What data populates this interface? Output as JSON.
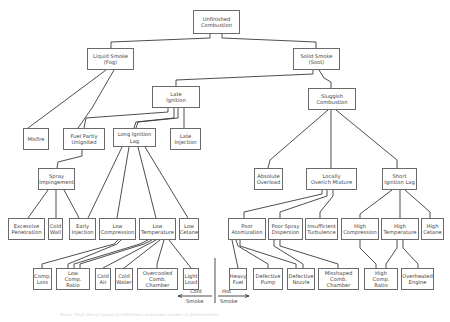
{
  "diagram": {
    "title": "Unfinished Combustion",
    "nodes": [
      {
        "id": "unfinished",
        "label": "Unfinished\nCombustion",
        "x": 193,
        "y": 10,
        "w": 47,
        "h": 24
      },
      {
        "id": "liquid",
        "label": "Liquid Smoke\n(Fog)",
        "x": 87,
        "y": 48,
        "w": 47,
        "h": 22
      },
      {
        "id": "solid",
        "label": "Solid Smoke\n(Soot)",
        "x": 293,
        "y": 48,
        "w": 47,
        "h": 22
      },
      {
        "id": "late_ign",
        "label": "Late\nIgnition",
        "x": 152,
        "y": 86,
        "w": 48,
        "h": 22
      },
      {
        "id": "sluggish",
        "label": "Sluggish\nCombustion",
        "x": 308,
        "y": 88,
        "w": 48,
        "h": 22
      },
      {
        "id": "misfire",
        "label": "Misfire",
        "x": 23,
        "y": 128,
        "w": 26,
        "h": 22
      },
      {
        "id": "fuel_partly",
        "label": "Fuel Partly\nUnignited",
        "x": 63,
        "y": 128,
        "w": 42,
        "h": 22
      },
      {
        "id": "long_lag",
        "label": "Long Ignition\nLag",
        "x": 113,
        "y": 128,
        "w": 43,
        "h": 19
      },
      {
        "id": "late_inj",
        "label": "Late\nInjection",
        "x": 170,
        "y": 128,
        "w": 31,
        "h": 22
      },
      {
        "id": "spray_imp",
        "label": "Spray\nImpingement",
        "x": 38,
        "y": 168,
        "w": 37,
        "h": 22
      },
      {
        "id": "abs_overload",
        "label": "Absolute\nOverload",
        "x": 254,
        "y": 168,
        "w": 29,
        "h": 22
      },
      {
        "id": "overich",
        "label": "Locally\nOverich Mixture",
        "x": 306,
        "y": 168,
        "w": 51,
        "h": 22
      },
      {
        "id": "short_lag",
        "label": "Short\nIgnition Lag",
        "x": 382,
        "y": 168,
        "w": 35,
        "h": 22
      },
      {
        "id": "exc_pen",
        "label": "Excessive\nPenetration",
        "x": 8,
        "y": 218,
        "w": 37,
        "h": 22
      },
      {
        "id": "cold_wall",
        "label": "Cold\nWall",
        "x": 48,
        "y": 218,
        "w": 15,
        "h": 22
      },
      {
        "id": "early_inj",
        "label": "Early\nInjection",
        "x": 69,
        "y": 218,
        "w": 27,
        "h": 22
      },
      {
        "id": "low_comp",
        "label": "Low\nCompression",
        "x": 99,
        "y": 218,
        "w": 37,
        "h": 22
      },
      {
        "id": "low_temp",
        "label": "Low\nTemperature",
        "x": 139,
        "y": 218,
        "w": 37,
        "h": 22
      },
      {
        "id": "low_cet",
        "label": "Low\nCetane",
        "x": 179,
        "y": 218,
        "w": 20,
        "h": 22
      },
      {
        "id": "poor_atom",
        "label": "Poor\nAtomization",
        "x": 228,
        "y": 218,
        "w": 38,
        "h": 22
      },
      {
        "id": "poor_spray",
        "label": "Poor Spray\nDispersion",
        "x": 268,
        "y": 218,
        "w": 35,
        "h": 22
      },
      {
        "id": "insuff_turb",
        "label": "Insufficient\nTurbulence",
        "x": 305,
        "y": 218,
        "w": 33,
        "h": 22
      },
      {
        "id": "high_comp",
        "label": "High\nCompression",
        "x": 341,
        "y": 218,
        "w": 38,
        "h": 22
      },
      {
        "id": "high_temp",
        "label": "High\nTemperature",
        "x": 381,
        "y": 218,
        "w": 38,
        "h": 22
      },
      {
        "id": "high_cet",
        "label": "High\nCetane",
        "x": 421,
        "y": 218,
        "w": 23,
        "h": 22
      },
      {
        "id": "comp_loss",
        "label": "Comp.\nLoss",
        "x": 33,
        "y": 268,
        "w": 19,
        "h": 22
      },
      {
        "id": "low_ratio",
        "label": "Low\nComp. Ratio",
        "x": 56,
        "y": 268,
        "w": 34,
        "h": 22
      },
      {
        "id": "cold_air",
        "label": "Cold\nAir",
        "x": 95,
        "y": 268,
        "w": 16,
        "h": 22
      },
      {
        "id": "cold_water",
        "label": "Cold\nWater",
        "x": 115,
        "y": 268,
        "w": 18,
        "h": 22
      },
      {
        "id": "overcooled",
        "label": "Overcooled\nComb.\nChamber",
        "x": 137,
        "y": 268,
        "w": 41,
        "h": 22
      },
      {
        "id": "light_load",
        "label": "Light\nLoad",
        "x": 183,
        "y": 268,
        "w": 16,
        "h": 22
      },
      {
        "id": "heavy_fuel",
        "label": "Heavy\nFuel",
        "x": 229,
        "y": 268,
        "w": 18,
        "h": 22
      },
      {
        "id": "def_pump",
        "label": "Defective\nPump",
        "x": 253,
        "y": 268,
        "w": 30,
        "h": 22
      },
      {
        "id": "def_nozzle",
        "label": "Defective\nNozzle",
        "x": 287,
        "y": 268,
        "w": 28,
        "h": 22
      },
      {
        "id": "misshaped",
        "label": "Misshaped\nComb.\nChamber",
        "x": 318,
        "y": 268,
        "w": 41,
        "h": 22
      },
      {
        "id": "high_ratio",
        "label": "High\nComp. Ratio",
        "x": 364,
        "y": 268,
        "w": 34,
        "h": 22
      },
      {
        "id": "overheated",
        "label": "Overheated\nEngine",
        "x": 401,
        "y": 268,
        "w": 33,
        "h": 22
      }
    ],
    "edges": [
      {
        "points": "210,34 210,38 111,42 111,48"
      },
      {
        "points": "222,34 222,38 316,42 316,48"
      },
      {
        "points": "106,70 55,108 28,128"
      },
      {
        "points": "114,70 92,108 78,128"
      },
      {
        "points": "313,70 313,74 176,80 176,86"
      },
      {
        "points": "319,70 324,78 331,82 331,88"
      },
      {
        "points": "168,108 168,112 86,118 84,128"
      },
      {
        "points": "174,108 174,118 136,122 134,128"
      },
      {
        "points": "178,108 178,118 138,122 136,128"
      },
      {
        "points": "184,108 184,128"
      },
      {
        "points": "82,150 82,156 58,162 57,168"
      },
      {
        "points": "328,110 270,160 268,168"
      },
      {
        "points": "331,110 331,168"
      },
      {
        "points": "336,110 397,160 397,168"
      },
      {
        "points": "48,190 28,218"
      },
      {
        "points": "56,190 56,218"
      },
      {
        "points": "64,190 77,214 79,218"
      },
      {
        "points": "122,147 88,218"
      },
      {
        "points": "129,147 117,218"
      },
      {
        "points": "138,147 156,218"
      },
      {
        "points": "145,147 188,218"
      },
      {
        "points": "322,190 322,194 244,212 244,218"
      },
      {
        "points": "327,190 327,196 280,212 280,218"
      },
      {
        "points": "333,190 333,196 320,212 320,218"
      },
      {
        "points": "392,190 360,214 360,218"
      },
      {
        "points": "400,190 400,218"
      },
      {
        "points": "405,190 430,212 430,218"
      },
      {
        "points": "118,240 114,244 42,264 42,268"
      },
      {
        "points": "121,240 117,244 68,264 68,268"
      },
      {
        "points": "148,240 140,244 74,264 74,268"
      },
      {
        "points": "152,240 144,244 80,264 80,268"
      },
      {
        "points": "156,240 103,268"
      },
      {
        "points": "160,240 124,268"
      },
      {
        "points": "164,240 157,264 157,268"
      },
      {
        "points": "169,240 191,268"
      },
      {
        "points": "232,240 238,268"
      },
      {
        "points": "236,240 238,246 268,264 268,268"
      },
      {
        "points": "240,240 240,246 296,264 296,268"
      },
      {
        "points": "274,240 274,246 303,264 303,268"
      },
      {
        "points": "280,240 280,246 338,264 338,268"
      },
      {
        "points": "360,240 360,248 376,264 376,268"
      },
      {
        "points": "397,240 397,248 386,264 386,268"
      },
      {
        "points": "403,240 403,248 418,264 418,268"
      }
    ]
  },
  "legend": {
    "left_label_1": "Cold",
    "left_label_2": "Smoke",
    "right_label_1": "Hot",
    "right_label_2": "Smoke"
  },
  "caption": "Figure: Fault tree of causes of unfinished combustion (smoke) in diesel engines"
}
